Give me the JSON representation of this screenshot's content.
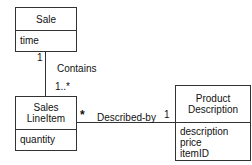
{
  "classes": {
    "sale": {
      "name": "Sale",
      "attributes": [
        "time"
      ]
    },
    "sales_line_item": {
      "name_line1": "Sales",
      "name_line2": "LineItem",
      "attributes": [
        "quantity"
      ]
    },
    "product_description": {
      "name_line1": "Product",
      "name_line2": "Description",
      "attributes": [
        "description",
        "price",
        "itemID"
      ]
    }
  },
  "associations": {
    "contains": {
      "label": "Contains",
      "from_multiplicity": "1",
      "to_multiplicity": "1..*"
    },
    "described_by": {
      "label": "Described-by",
      "from_multiplicity": "*",
      "to_multiplicity": "1"
    }
  }
}
